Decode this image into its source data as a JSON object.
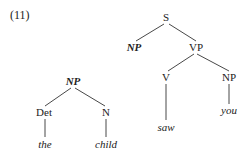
{
  "example_number": "(11)",
  "tree_left": {
    "root": "NP",
    "children": [
      {
        "label": "Det",
        "leaf": "the"
      },
      {
        "label": "N",
        "leaf": "child"
      }
    ]
  },
  "tree_right": {
    "root": "S",
    "subject": "NP",
    "vp": {
      "label": "VP",
      "verb": {
        "label": "V",
        "leaf": "saw"
      },
      "object": {
        "label": "NP",
        "leaf": "you"
      }
    }
  },
  "colors": {
    "text": "#222222",
    "line": "#333333"
  }
}
